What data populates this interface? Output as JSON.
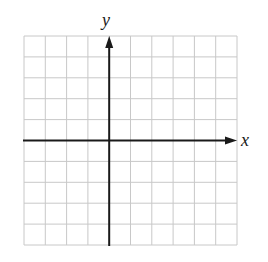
{
  "diagram": {
    "type": "coordinate-plane",
    "x_axis_label": "x",
    "y_axis_label": "y",
    "grid": {
      "columns": 10,
      "rows": 10,
      "left": 24,
      "top": 36,
      "cell_width": 21.3,
      "cell_height": 20.9,
      "line_color": "#c8c8c8",
      "axis_color": "#1a1a1a"
    },
    "origin_grid_position": {
      "column": 4,
      "row": 5
    }
  }
}
